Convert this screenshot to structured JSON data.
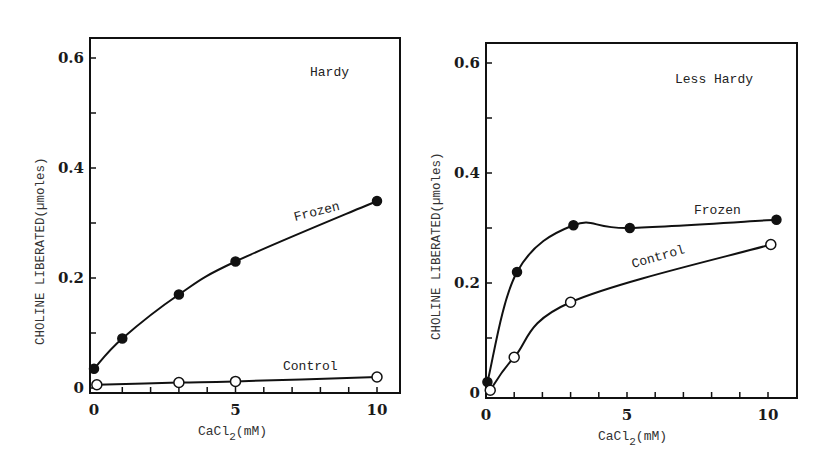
{
  "chart_data": [
    {
      "type": "line",
      "title": "Hardy",
      "xlabel": "CaCl2(mM)",
      "ylabel": "CHOLINE LIBERATED(µmoles)",
      "xlim": [
        0,
        11
      ],
      "ylim": [
        0,
        0.63
      ],
      "x_ticks": [
        0,
        5,
        10
      ],
      "y_ticks": [
        0,
        0.2,
        0.4,
        0.6
      ],
      "y_tick_labels": [
        "0",
        "0.2",
        "0.4",
        "0.6"
      ],
      "grid": false,
      "legend": "inline labels",
      "series": [
        {
          "name": "Frozen",
          "marker": "filled-circle",
          "x": [
            0,
            1,
            3,
            5,
            10
          ],
          "y": [
            0.035,
            0.09,
            0.17,
            0.23,
            0.34
          ]
        },
        {
          "name": "Control",
          "marker": "open-circle",
          "x": [
            0.1,
            3,
            5,
            10
          ],
          "y": [
            0.006,
            0.01,
            0.012,
            0.02
          ]
        }
      ]
    },
    {
      "type": "line",
      "title": "Less Hardy",
      "xlabel": "CaCl2(mM)",
      "ylabel": "CHOLINE LIBERATED(µmoles)",
      "xlim": [
        0,
        11
      ],
      "ylim": [
        0,
        0.63
      ],
      "x_ticks": [
        0,
        5,
        10
      ],
      "y_ticks": [
        0,
        0.2,
        0.4,
        0.6
      ],
      "y_tick_labels": [
        "0",
        "0.2",
        "0.4",
        "0.6"
      ],
      "grid": false,
      "legend": "inline labels",
      "series": [
        {
          "name": "Frozen",
          "marker": "filled-circle",
          "x": [
            0.05,
            1.1,
            3.1,
            5.1,
            10.3
          ],
          "y": [
            0.02,
            0.22,
            0.305,
            0.3,
            0.315
          ]
        },
        {
          "name": "Control",
          "marker": "open-circle",
          "x": [
            0.15,
            1,
            3,
            10.1
          ],
          "y": [
            0.005,
            0.065,
            0.165,
            0.27
          ]
        }
      ]
    }
  ],
  "panels": [
    {
      "title": "Hardy",
      "ylabel": "CHOLINE LIBERATED(µmoles)",
      "xlabel_main": "CaCl",
      "xlabel_sub": "2",
      "xlabel_unit": "(mM)",
      "frozen_label": "Frozen",
      "control_label": "Control"
    },
    {
      "title": "Less Hardy",
      "ylabel": "CHOLINE LIBERATED(µmoles)",
      "xlabel_main": "CaCl",
      "xlabel_sub": "2",
      "xlabel_unit": "(mM)",
      "frozen_label": "Frozen",
      "control_label": "Control"
    }
  ],
  "colors": {
    "ink": "#111111",
    "background": "#ffffff"
  }
}
